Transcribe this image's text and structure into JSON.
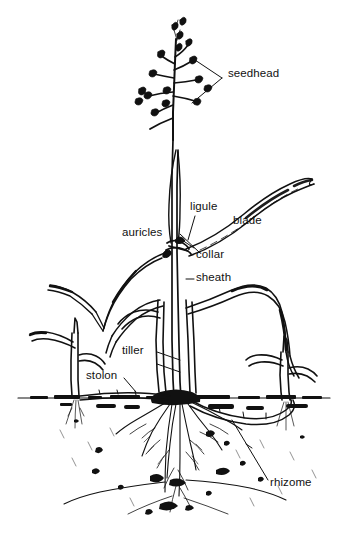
{
  "figure": {
    "type": "botanical-line-drawing",
    "background_color": "#ffffff",
    "ink_color": "#111111",
    "width": 344,
    "height": 553
  },
  "labels": {
    "seedhead": {
      "text": "seedhead",
      "x": 228,
      "y": 74,
      "leader": "angle-bracket"
    },
    "ligule": {
      "text": "ligule",
      "x": 190,
      "y": 200,
      "leader": "line-down"
    },
    "blade": {
      "text": "blade",
      "x": 233,
      "y": 214,
      "leader": "none"
    },
    "auricles": {
      "text": "auricles",
      "x": 123,
      "y": 227,
      "leader": "line-right-down"
    },
    "collar": {
      "text": "collar",
      "x": 196,
      "y": 249,
      "leader": "line-up-left"
    },
    "sheath": {
      "text": "sheath",
      "x": 196,
      "y": 277,
      "leader": "dash-left"
    },
    "tiller": {
      "text": "tiller",
      "x": 123,
      "y": 349,
      "leader": "line-right-down"
    },
    "stolon": {
      "text": "stolon",
      "x": 88,
      "y": 372,
      "leader": "line-down-right"
    },
    "rhizome": {
      "text": "rhizome",
      "x": 271,
      "y": 483,
      "leader": "long-diagonal-up-left"
    }
  },
  "plant_parts": {
    "seedhead_description": "open panicle with spikelets on spreading pedicels",
    "culm_description": "erect central stem with sheath and collar node",
    "soil_line_y": 398,
    "root_description": "fibrous root system below crown",
    "stolon_description": "horizontal above-ground runner to left shoot",
    "rhizome_description": "horizontal below-ground stem to right shoot",
    "tiller_description": "secondary shoot arising at base"
  }
}
